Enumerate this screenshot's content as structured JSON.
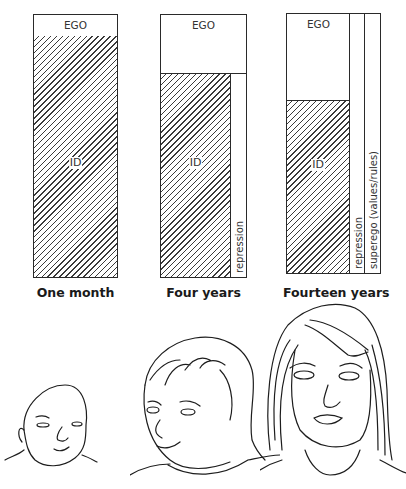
{
  "diagram": {
    "bars": [
      {
        "caption": "One month",
        "ego_label": "EGO",
        "id_label": "ID",
        "columns": []
      },
      {
        "caption": "Four years",
        "ego_label": "EGO",
        "id_label": "ID",
        "columns": [
          {
            "label": "repression"
          }
        ]
      },
      {
        "caption": "Fourteen years",
        "ego_label": "EGO",
        "id_label": "ID",
        "columns": [
          {
            "label": "repression"
          },
          {
            "label": "superego (values/rules)"
          }
        ]
      }
    ],
    "illustrations": [
      {
        "name": "infant-face",
        "depicts": "baby"
      },
      {
        "name": "child-face",
        "depicts": "young child"
      },
      {
        "name": "teen-face",
        "depicts": "teenage girl"
      }
    ],
    "colors": {
      "line": "#2a2a2a",
      "background": "#ffffff"
    }
  }
}
